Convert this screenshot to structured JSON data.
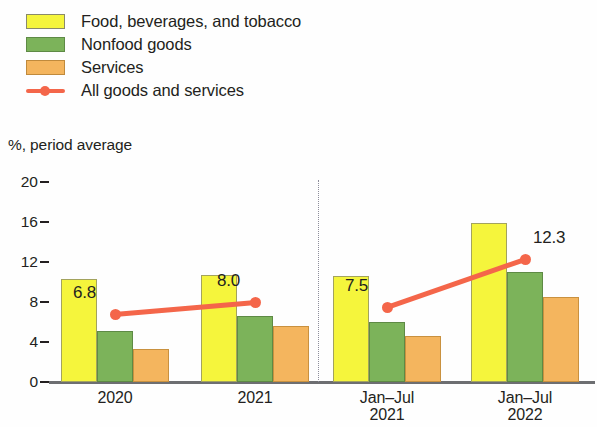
{
  "legend": {
    "items": [
      {
        "label": "Food, beverages, and tobacco",
        "color": "#F5F53C",
        "type": "swatch",
        "icon": "yellow-swatch-icon"
      },
      {
        "label": "Nonfood goods",
        "color": "#7CB35A",
        "type": "swatch",
        "icon": "green-swatch-icon"
      },
      {
        "label": "Services",
        "color": "#F4B55E",
        "type": "swatch",
        "icon": "orange-swatch-icon"
      },
      {
        "label": "All goods and services",
        "color": "#F4664A",
        "type": "line",
        "icon": "line-marker-icon"
      }
    ]
  },
  "chart_data": {
    "type": "bar",
    "title": "",
    "subtitle": "",
    "xlabel": "",
    "ylabel": "%, period average",
    "ylim": [
      0,
      20
    ],
    "yticks": [
      0,
      4,
      8,
      12,
      16,
      20
    ],
    "ytick_labels": [
      "0",
      "4",
      "8",
      "12",
      "16",
      "20"
    ],
    "grid": false,
    "legend_position": "top-left",
    "categories": [
      "2020",
      "2021",
      "Jan–Jul 2021",
      "Jan–Jul 2022"
    ],
    "category_lines": [
      [
        "",
        "2020"
      ],
      [
        "",
        "2021"
      ],
      [
        "Jan–Jul",
        "2021"
      ],
      [
        "Jan–Jul",
        "2022"
      ]
    ],
    "series": [
      {
        "name": "Food, beverages, and tobacco",
        "color": "#F5F53C",
        "values": [
          10.3,
          10.7,
          10.6,
          15.9
        ]
      },
      {
        "name": "Nonfood goods",
        "color": "#7CB35A",
        "values": [
          5.1,
          6.6,
          6.0,
          11.0
        ]
      },
      {
        "name": "Services",
        "color": "#F4B55E",
        "values": [
          3.3,
          5.6,
          4.6,
          8.5
        ]
      }
    ],
    "line_series": {
      "name": "All goods and services",
      "color": "#F4664A",
      "values": [
        6.8,
        8.0,
        7.5,
        12.3
      ],
      "labels": [
        "6.8",
        "8.0",
        "7.5",
        "12.3"
      ],
      "segments": [
        [
          0,
          1
        ],
        [
          2,
          3
        ]
      ]
    },
    "annotations": {
      "divider": {
        "type": "vertical-dotted-line",
        "between_categories": [
          1,
          2
        ]
      }
    }
  }
}
